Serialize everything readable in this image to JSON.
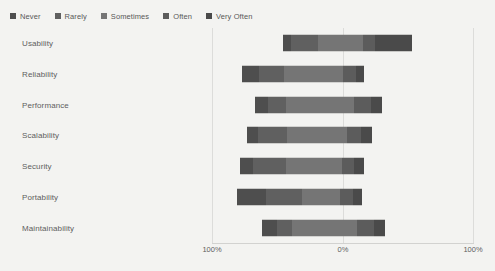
{
  "chart_data": {
    "type": "bar",
    "subtype": "diverging-stacked-likert",
    "title": "",
    "subtitle": "",
    "xlabel": "",
    "ylabel": "",
    "orientation": "horizontal",
    "grid": true,
    "legend_position": "top-left",
    "axis": {
      "ticks": [
        "100%",
        "0%",
        "100%"
      ],
      "tick_values": [
        -100,
        0,
        100
      ],
      "xlim": [
        -100,
        100
      ],
      "center_value": 0
    },
    "categories": [
      "Usability",
      "Reliability",
      "Performance",
      "Scalability",
      "Security",
      "Portability",
      "Maintainability"
    ],
    "series": [
      {
        "name": "Never",
        "color": "#4e4e4e",
        "values": [
          9,
          13,
          10,
          8,
          11,
          22,
          12
        ]
      },
      {
        "name": "Rarely",
        "color": "#606060",
        "values": [
          30,
          19,
          13,
          23,
          27,
          28,
          11
        ]
      },
      {
        "name": "Sometimes",
        "color": "#757575",
        "values": [
          49,
          46,
          52,
          46,
          46,
          29,
          50
        ]
      },
      {
        "name": "Often",
        "color": "#5c5c5c",
        "values": [
          13,
          10,
          13,
          11,
          10,
          10,
          13
        ]
      },
      {
        "name": "Very Often",
        "color": "#4a4a4a",
        "values": [
          40,
          6,
          8,
          8,
          8,
          7,
          8
        ]
      }
    ],
    "negative_extent": [
      46,
      77,
      67,
      73,
      79,
      81,
      62
    ],
    "positive_extent": [
      53,
      16,
      30,
      22,
      16,
      15,
      32
    ]
  },
  "legend": {
    "items": [
      {
        "label": "Never",
        "color": "#4e4e4e",
        "swatch": "square-swatch"
      },
      {
        "label": "Rarely",
        "color": "#606060",
        "swatch": "square-swatch"
      },
      {
        "label": "Sometimes",
        "color": "#757575",
        "swatch": "square-swatch"
      },
      {
        "label": "Often",
        "color": "#5c5c5c",
        "swatch": "square-swatch"
      },
      {
        "label": "Very Often",
        "color": "#4a4a4a",
        "swatch": "square-swatch"
      }
    ]
  },
  "colors": {
    "background": "#f3f3f1",
    "gridline": "#dcdcda",
    "text": "#5e5e5e"
  }
}
